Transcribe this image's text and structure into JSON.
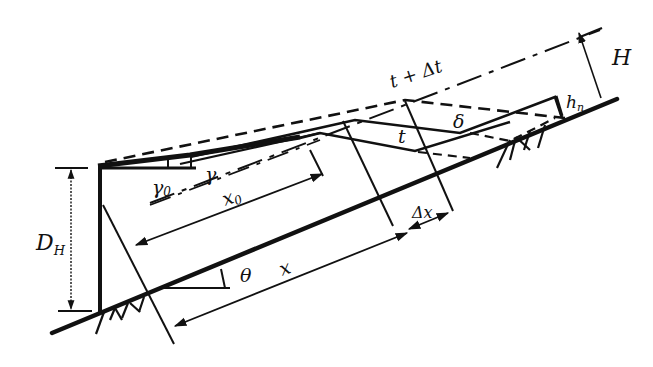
{
  "diagram": {
    "type": "engineering schematic",
    "colors": {
      "ink": "#111111",
      "background": "#ffffff"
    },
    "labels": {
      "D_H": "D",
      "D_H_sub": "H",
      "gamma0": "γ",
      "gamma0_sub": "0",
      "gamma": "γ",
      "x0": "x",
      "x0_sub": "0",
      "theta": "θ",
      "x": "x",
      "delta_x": "Δx",
      "t": "t",
      "t_plus_dt": "t + Δt",
      "delta": "δ",
      "h_n": "h",
      "h_n_sub": "n",
      "H": "H"
    }
  }
}
